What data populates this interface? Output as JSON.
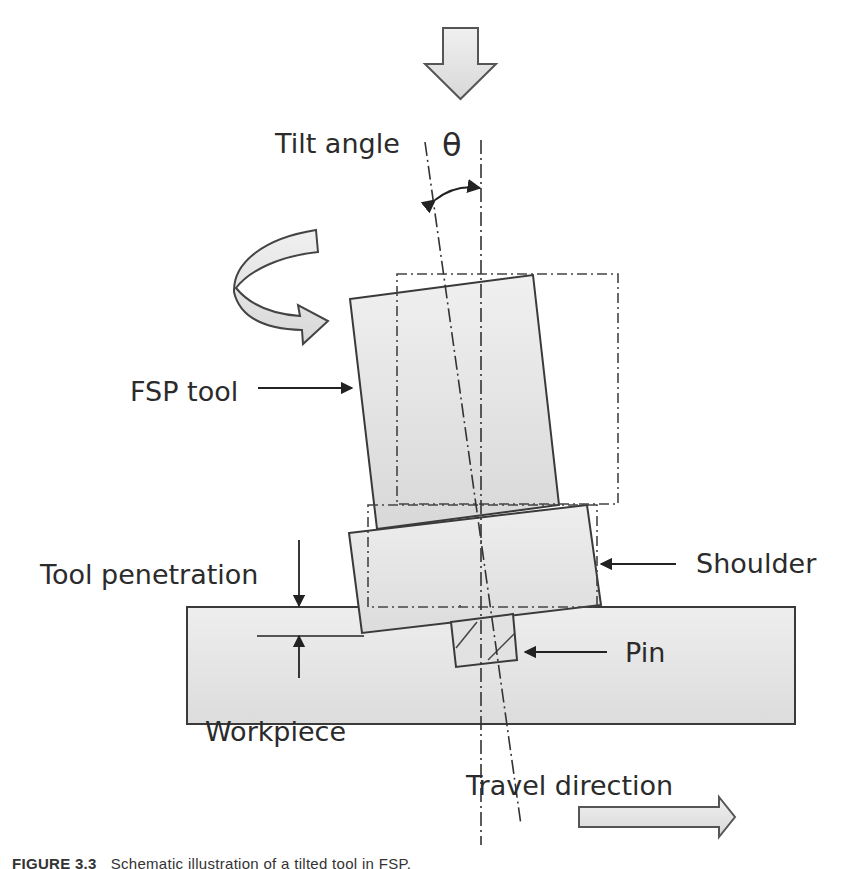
{
  "diagram": {
    "labels": {
      "tilt_angle": "Tilt angle",
      "theta": "θ",
      "fsp_tool": "FSP tool",
      "tool_penetration": "Tool penetration",
      "shoulder": "Shoulder",
      "pin": "Pin",
      "workpiece": "Workpiece",
      "travel_direction": "Travel direction"
    },
    "arrows": {
      "top": "down-force-arrow",
      "rotation": "rotation-arrow",
      "travel": "travel-direction-arrow"
    },
    "colors": {
      "fill": "#e4e4e4",
      "stroke": "#3a3a3a",
      "text": "#2b2b2b",
      "background": "#ffffff"
    }
  },
  "caption": {
    "figure": "FIGURE 3.3",
    "text": "Schematic illustration of a tilted tool in FSP."
  }
}
